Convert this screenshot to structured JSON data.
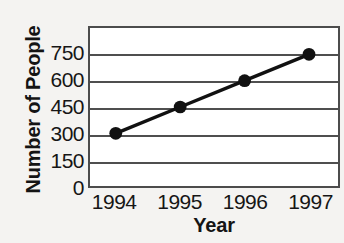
{
  "chart_data": {
    "type": "line",
    "title": "",
    "xlabel": "Year",
    "ylabel": "Number of People",
    "categories": [
      "1994",
      "1995",
      "1996",
      "1997"
    ],
    "x": [
      1994,
      1995,
      1996,
      1997
    ],
    "values": [
      300,
      450,
      600,
      750
    ],
    "series": [
      {
        "name": "Number of People",
        "values": [
          300,
          450,
          600,
          750
        ]
      }
    ],
    "ylim": [
      0,
      900
    ],
    "xlim": [
      1993.6,
      1997.45
    ],
    "ytick_labels": [
      "750",
      "600",
      "450",
      "300",
      "150",
      "0"
    ],
    "ytick_values": [
      750,
      600,
      450,
      300,
      150,
      0
    ],
    "ytick_step": 150,
    "gridlines": {
      "horizontal": true,
      "vertical": false,
      "values": [
        900,
        750,
        600,
        450,
        300,
        150
      ]
    },
    "legend": {
      "visible": false,
      "position": "none"
    },
    "annotations": [],
    "colors": {
      "line": "#111111",
      "marker": "#111111",
      "grid": "#4f4f4f",
      "frame": "#4c4c4c",
      "plot_background": "#ffffff",
      "page_background": "#f4f3f1",
      "text": "#141414"
    },
    "marker": {
      "shape": "circle",
      "radius": 6.5
    },
    "line_width": 3.5
  }
}
